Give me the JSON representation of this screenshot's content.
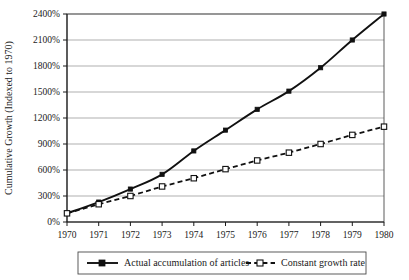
{
  "chart_data": {
    "type": "line",
    "title": "",
    "xlabel": "",
    "ylabel": "Cumulative Growth (Indexed to 1970)",
    "x": [
      1970,
      1971,
      1972,
      1973,
      1974,
      1975,
      1976,
      1977,
      1978,
      1979,
      1980
    ],
    "categories": [
      "1970",
      "1971",
      "1972",
      "1973",
      "1974",
      "1975",
      "1976",
      "1977",
      "1978",
      "1979",
      "1980"
    ],
    "series": [
      {
        "name": "Actual accumulation of articles",
        "marker": "filled-square",
        "line_style": "solid",
        "values": [
          100,
          230,
          380,
          550,
          820,
          1060,
          1300,
          1510,
          1780,
          2100,
          2400
        ]
      },
      {
        "name": "Constant growth rate",
        "marker": "open-square",
        "line_style": "dashed",
        "values": [
          100,
          205,
          300,
          410,
          505,
          610,
          710,
          800,
          900,
          1005,
          1100
        ]
      }
    ],
    "ylim": [
      0,
      2400
    ],
    "xlim": [
      1970,
      1980
    ],
    "y_ticks": [
      0,
      300,
      600,
      900,
      1200,
      1500,
      1800,
      2100,
      2400
    ],
    "y_tick_labels": [
      "0%",
      "300%",
      "600%",
      "900%",
      "1200%",
      "1500%",
      "1800%",
      "2100%",
      "2400%"
    ],
    "x_tick_labels": [
      "1970",
      "1971",
      "1972",
      "1973",
      "1974",
      "1975",
      "1976",
      "1977",
      "1978",
      "1979",
      "1980"
    ],
    "grid": "horizontal",
    "legend_position": "bottom",
    "colors": {
      "line": "#111111",
      "grid": "#8d8d8d",
      "axis": "#1a1a1a",
      "background": "#ffffff"
    }
  },
  "legend": {
    "entries": [
      {
        "label": "Actual accumulation of articles"
      },
      {
        "label": "Constant growth rate"
      }
    ]
  }
}
